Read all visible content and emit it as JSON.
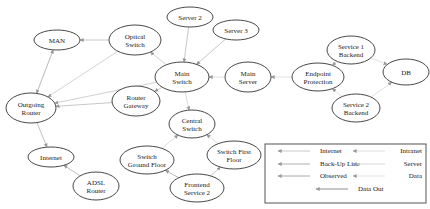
{
  "diagram": {
    "title": "",
    "nodes": [
      {
        "id": "man",
        "label": [
          "MAN"
        ],
        "cx": 57,
        "cy": 40,
        "rx": 23,
        "ry": 10
      },
      {
        "id": "optical_switch",
        "label": [
          "Optical",
          "Switch"
        ],
        "cx": 135,
        "cy": 40,
        "rx": 26,
        "ry": 15
      },
      {
        "id": "server2",
        "label": [
          "Server 2"
        ],
        "cx": 190,
        "cy": 17,
        "rx": 23,
        "ry": 10
      },
      {
        "id": "server3",
        "label": [
          "Server 3"
        ],
        "cx": 236,
        "cy": 30,
        "rx": 23,
        "ry": 10
      },
      {
        "id": "main_switch",
        "label": [
          "Main",
          "Switch"
        ],
        "cx": 182,
        "cy": 77,
        "rx": 27,
        "ry": 15
      },
      {
        "id": "main_server",
        "label": [
          "Main",
          "Server"
        ],
        "cx": 248,
        "cy": 77,
        "rx": 23,
        "ry": 15
      },
      {
        "id": "router_gateway",
        "label": [
          "Router",
          "Gateway"
        ],
        "cx": 136,
        "cy": 101,
        "rx": 24,
        "ry": 15
      },
      {
        "id": "outgoing_router",
        "label": [
          "Outgoing",
          "Router"
        ],
        "cx": 31,
        "cy": 108,
        "rx": 25,
        "ry": 15
      },
      {
        "id": "endpoint_protection",
        "label": [
          "Endpoint",
          "Protection"
        ],
        "cx": 318,
        "cy": 77,
        "rx": 26,
        "ry": 14
      },
      {
        "id": "service1_backend",
        "label": [
          "Service 1",
          "Backend"
        ],
        "cx": 351,
        "cy": 50,
        "rx": 24,
        "ry": 14
      },
      {
        "id": "db",
        "label": [
          "DB"
        ],
        "cx": 406,
        "cy": 72,
        "rx": 23,
        "ry": 13
      },
      {
        "id": "service2_backend",
        "label": [
          "Service 2",
          "Backend"
        ],
        "cx": 356,
        "cy": 108,
        "rx": 24,
        "ry": 14
      },
      {
        "id": "central_switch",
        "label": [
          "Central",
          "Switch"
        ],
        "cx": 192,
        "cy": 124,
        "rx": 23,
        "ry": 14
      },
      {
        "id": "switch_ground_floor",
        "label": [
          "Switch",
          "Ground Floor"
        ],
        "cx": 147,
        "cy": 160,
        "rx": 27,
        "ry": 14
      },
      {
        "id": "switch_first_floor",
        "label": [
          "Switch First",
          "Floor"
        ],
        "cx": 234,
        "cy": 155,
        "rx": 27,
        "ry": 14
      },
      {
        "id": "frontend_service2",
        "label": [
          "Frontend",
          "Service 2"
        ],
        "cx": 197,
        "cy": 188,
        "rx": 27,
        "ry": 14
      },
      {
        "id": "internet",
        "label": [
          "Internet"
        ],
        "cx": 51,
        "cy": 157,
        "rx": 23,
        "ry": 10
      },
      {
        "id": "adsl_router",
        "label": [
          "ADSL",
          "Router"
        ],
        "cx": 96,
        "cy": 186,
        "rx": 23,
        "ry": 14
      }
    ],
    "edges": [
      {
        "from": "optical_switch",
        "to": "man",
        "color": "#c8c8c8"
      },
      {
        "from": "man",
        "to": "outgoing_router",
        "color": "#b8b8b8",
        "both": true
      },
      {
        "from": "optical_switch",
        "to": "outgoing_router",
        "color": "#d4d4d4"
      },
      {
        "from": "main_switch",
        "to": "optical_switch",
        "color": "#d4d4d4"
      },
      {
        "from": "server2",
        "to": "main_switch",
        "color": "#c8c8c8"
      },
      {
        "from": "server3",
        "to": "main_switch",
        "color": "#c8c8c8"
      },
      {
        "from": "main_switch",
        "to": "outgoing_router",
        "color": "#d0d0d0"
      },
      {
        "from": "router_gateway",
        "to": "outgoing_router",
        "color": "#c8c8c8"
      },
      {
        "from": "main_switch",
        "to": "router_gateway",
        "color": "#d0d0d0"
      },
      {
        "from": "main_server",
        "to": "main_switch",
        "color": "#e0e0e0"
      },
      {
        "from": "endpoint_protection",
        "to": "main_server",
        "color": "#e4e4e4"
      },
      {
        "from": "main_switch",
        "to": "central_switch",
        "color": "#dcdcdc"
      },
      {
        "from": "service1_backend",
        "to": "endpoint_protection",
        "color": "#e0e0e0"
      },
      {
        "from": "service2_backend",
        "to": "endpoint_protection",
        "color": "#e0e0e0"
      },
      {
        "from": "service1_backend",
        "to": "db",
        "color": "#e0e0e0"
      },
      {
        "from": "service2_backend",
        "to": "db",
        "color": "#e0e0e0"
      },
      {
        "from": "switch_ground_floor",
        "to": "central_switch",
        "color": "#e0e0e0"
      },
      {
        "from": "switch_first_floor",
        "to": "central_switch",
        "color": "#e0e0e0"
      },
      {
        "from": "frontend_service2",
        "to": "switch_ground_floor",
        "color": "#b8b8b8"
      },
      {
        "from": "frontend_service2",
        "to": "switch_first_floor",
        "color": "#c8c8c8"
      },
      {
        "from": "outgoing_router",
        "to": "internet",
        "color": "#c0c0c0"
      },
      {
        "from": "adsl_router",
        "to": "internet",
        "color": "#c0c0c0"
      }
    ]
  },
  "legend": {
    "box": {
      "x": 265,
      "y": 144,
      "w": 161,
      "h": 59
    },
    "items": [
      {
        "label": "Internet",
        "color": "#c8c8c8",
        "x": 278,
        "y": 153
      },
      {
        "label": "Back-Up Line",
        "color": "#b0b0b0",
        "x": 278,
        "y": 166
      },
      {
        "label": "Observed",
        "color": "#a8a8a8",
        "x": 278,
        "y": 178
      },
      {
        "label": "Intranet",
        "color": "#e0e0e0",
        "x": 353,
        "y": 153
      },
      {
        "label": "Server",
        "color": "#d8d8d8",
        "x": 353,
        "y": 166
      },
      {
        "label": "Data",
        "color": "#e4e4e4",
        "x": 353,
        "y": 178
      },
      {
        "label": "Data Out",
        "color": "#909090",
        "x": 316,
        "y": 191
      }
    ]
  }
}
